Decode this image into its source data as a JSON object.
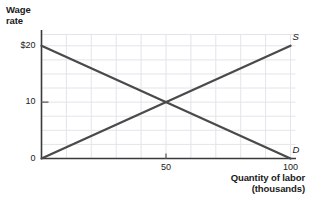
{
  "chart_data": {
    "type": "line",
    "title": "",
    "xlabel": "Quantity of labor (thousands)",
    "ylabel": "Wage rate",
    "xlim": [
      0,
      100
    ],
    "ylim": [
      0,
      22
    ],
    "grid": true,
    "legend_position": "inline-end-labels",
    "x_ticks": [
      {
        "value": 0,
        "label": ""
      },
      {
        "value": 50,
        "label": "50"
      },
      {
        "value": 100,
        "label": "100"
      }
    ],
    "y_ticks": [
      {
        "value": 0,
        "label": "0"
      },
      {
        "value": 10,
        "label": "10"
      },
      {
        "value": 20,
        "label": "$20"
      }
    ],
    "gridlines": {
      "x_values": [
        10,
        20,
        30,
        40,
        50,
        60,
        70,
        80,
        90,
        100
      ],
      "y_values": [
        2.5,
        5,
        7.5,
        10,
        12.5,
        15,
        17.5,
        20,
        22
      ]
    },
    "series": [
      {
        "name": "D",
        "label": "D",
        "color": "#4a4a4a",
        "points": [
          {
            "x": 0,
            "y": 20
          },
          {
            "x": 100,
            "y": 0
          }
        ]
      },
      {
        "name": "S",
        "label": "S",
        "color": "#4a4a4a",
        "points": [
          {
            "x": 0,
            "y": 0
          },
          {
            "x": 100,
            "y": 20
          }
        ]
      }
    ],
    "equilibrium": {
      "x": 50,
      "y": 10
    }
  },
  "axes": {
    "y_title_line1": "Wage",
    "y_title_line2": "rate",
    "x_title_line1": "Quantity of labor",
    "x_title_line2": "(thousands)"
  },
  "colors": {
    "curve": "#4a4a4a",
    "axis": "#3a3a3a",
    "grid": "#e4e4ea",
    "text": "#1a1a1a"
  }
}
